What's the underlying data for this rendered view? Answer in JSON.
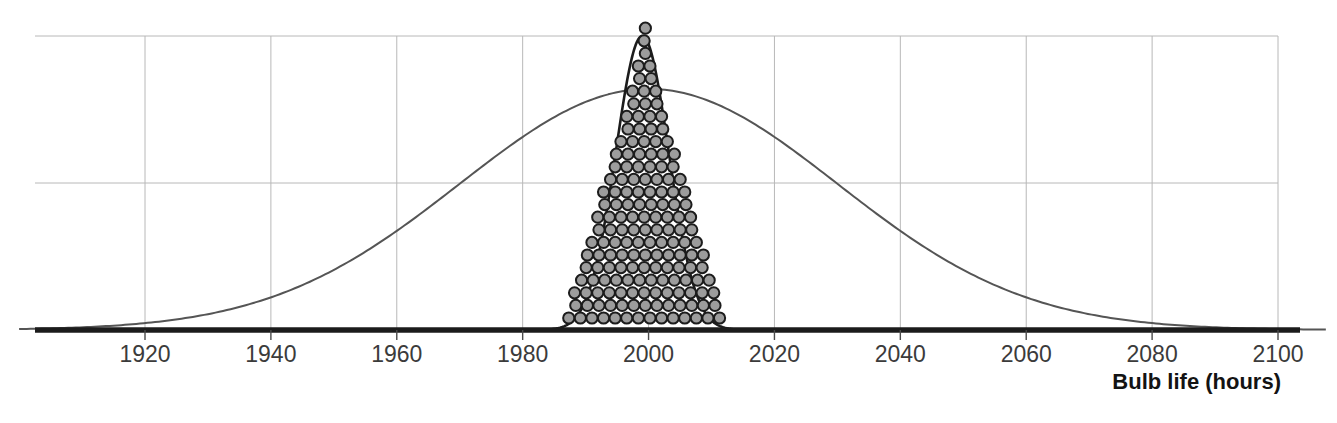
{
  "chart_data": {
    "type": "line",
    "title": "",
    "subtitle": "",
    "xlabel": "Bulb life (hours)",
    "ylabel": "",
    "xlim": [
      1905,
      2100
    ],
    "ylim": [
      0,
      1.08
    ],
    "grid": true,
    "legend": null,
    "xticks": [
      1920,
      1940,
      1960,
      1980,
      2000,
      2020,
      2040,
      2060,
      2080,
      2100
    ],
    "xtick_labels": [
      "1920",
      "1940",
      "1960",
      "1980",
      "2000",
      "2020",
      "2040",
      "2060",
      "2080",
      "2100"
    ],
    "yticks": [
      0.0,
      0.5,
      1.0
    ],
    "ytick_labels": [
      "",
      "",
      ""
    ],
    "annotations": [],
    "series": [
      {
        "name": "population-distribution",
        "type": "line",
        "kind": "normal-curve",
        "mean": 2000,
        "sd": 30,
        "peak_height": 0.82,
        "color": "#555555",
        "linewidth": 2.0
      },
      {
        "name": "sampling-distribution-of-mean",
        "type": "line",
        "kind": "normal-curve",
        "mean": 1999,
        "sd": 4.2,
        "peak_height": 1.0,
        "color": "#1c1c1c",
        "linewidth": 2.6
      },
      {
        "name": "sample-means-dotplot",
        "type": "dotplot",
        "dot_fill": "#9c9c9c",
        "dot_stroke": "#1c1c1c",
        "dot_diameter_hours": 1.75,
        "total_dots": 142,
        "stacks": [
          {
            "x": 1992.0,
            "count": 1
          },
          {
            "x": 1993.3,
            "count": 3
          },
          {
            "x": 1994.1,
            "count": 6
          },
          {
            "x": 1994.9,
            "count": 9
          },
          {
            "x": 1995.6,
            "count": 11
          },
          {
            "x": 1996.4,
            "count": 13
          },
          {
            "x": 1997.2,
            "count": 15
          },
          {
            "x": 1998.0,
            "count": 20
          },
          {
            "x": 1998.8,
            "count": 19
          },
          {
            "x": 1999.6,
            "count": 16
          },
          {
            "x": 2000.4,
            "count": 13
          },
          {
            "x": 2001.2,
            "count": 10
          },
          {
            "x": 2002.0,
            "count": 7
          },
          {
            "x": 2002.8,
            "count": 5
          },
          {
            "x": 2003.6,
            "count": 3
          },
          {
            "x": 2004.6,
            "count": 1
          }
        ],
        "rows": [
          {
            "row": 1,
            "count": 14
          },
          {
            "row": 2,
            "count": 13
          },
          {
            "row": 3,
            "count": 13
          },
          {
            "row": 4,
            "count": 12
          },
          {
            "row": 5,
            "count": 11
          },
          {
            "row": 6,
            "count": 11
          },
          {
            "row": 7,
            "count": 10
          },
          {
            "row": 8,
            "count": 9
          },
          {
            "row": 9,
            "count": 9
          },
          {
            "row": 10,
            "count": 8
          },
          {
            "row": 11,
            "count": 8
          },
          {
            "row": 12,
            "count": 7
          },
          {
            "row": 13,
            "count": 6
          },
          {
            "row": 14,
            "count": 6
          },
          {
            "row": 15,
            "count": 5
          },
          {
            "row": 16,
            "count": 4
          },
          {
            "row": 17,
            "count": 4
          },
          {
            "row": 18,
            "count": 3
          },
          {
            "row": 19,
            "count": 3
          },
          {
            "row": 20,
            "count": 2
          },
          {
            "row": 21,
            "count": 2
          },
          {
            "row": 22,
            "count": 1
          },
          {
            "row": 23,
            "count": 1
          },
          {
            "row": 24,
            "count": 1
          }
        ]
      }
    ]
  },
  "axis": {
    "title": "Bulb life (hours)"
  },
  "colors": {
    "gridline": "#b8b8b8",
    "baseline": "#1c1c1c",
    "tick_text": "#3b3b3b",
    "axis_title_text": "#131313",
    "wide_curve": "#555555",
    "narrow_curve": "#1c1c1c",
    "dot_fill": "#9c9c9c",
    "dot_stroke": "#1c1c1c",
    "background": "#ffffff"
  }
}
